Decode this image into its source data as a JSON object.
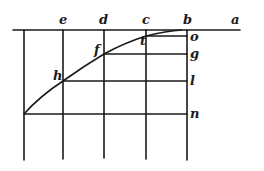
{
  "diagram": {
    "top_labels": [
      {
        "id": "e",
        "text": "e"
      },
      {
        "id": "d",
        "text": "d"
      },
      {
        "id": "c",
        "text": "c"
      },
      {
        "id": "b",
        "text": "b"
      },
      {
        "id": "a",
        "text": "a"
      }
    ],
    "curve_points": [
      {
        "id": "h",
        "text": "h"
      },
      {
        "id": "f",
        "text": "f"
      },
      {
        "id": "t",
        "text": "t"
      }
    ],
    "right_labels": [
      {
        "id": "o",
        "text": "o"
      },
      {
        "id": "g",
        "text": "g"
      },
      {
        "id": "l",
        "text": "l"
      },
      {
        "id": "n",
        "text": "n"
      }
    ],
    "colors": {
      "ink": "#1a1a1a",
      "paper": "#ffffff"
    }
  }
}
